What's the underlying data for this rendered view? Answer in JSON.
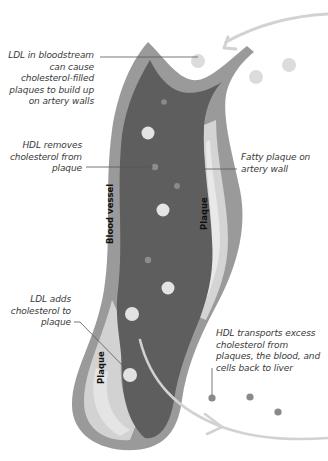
{
  "diagram": {
    "type": "cholesterol-transport-illustration",
    "colors": {
      "vessel_outer_wall": "#9a9a9a",
      "vessel_lumen": "#5e5e5e",
      "plaque": "#d4d4d4",
      "plaque_inner_band": "#e6e6e6",
      "particle_light": "#e4e4e4",
      "particle_dark": "#8a8a8a",
      "arrow": "#cfcfcf",
      "leader_line": "#555555",
      "text": "#3a3a3a"
    },
    "annotations": [
      {
        "id": "ldl-bloodstream",
        "text_lines": [
          "LDL in bloodstream",
          "can cause",
          "cholesterol-filled",
          "plaques to build up",
          "on artery walls"
        ]
      },
      {
        "id": "hdl-removes",
        "text_lines": [
          "HDL removes",
          "cholesterol from",
          "plaque"
        ]
      },
      {
        "id": "fatty-plaque",
        "text_lines": [
          "Fatty plaque on",
          "artery wall"
        ]
      },
      {
        "id": "ldl-adds",
        "text_lines": [
          "LDL adds",
          "cholesterol to",
          "plaque"
        ]
      },
      {
        "id": "hdl-transports",
        "text_lines": [
          "HDL transports excess",
          "cholesterol from",
          "plaques, the blood, and",
          "cells back to liver"
        ]
      }
    ],
    "vessel_labels": {
      "blood_vessel": "Blood vessel",
      "plaque_upper": "Plaque",
      "plaque_lower": "Plaque"
    }
  }
}
